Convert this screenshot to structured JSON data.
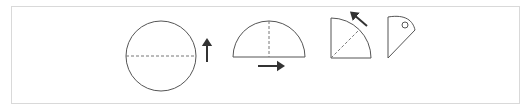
{
  "panel": {
    "name": "geometric-figures-panel",
    "background_color": "#ffffff",
    "border_color": "#d9d9d9",
    "x": 11,
    "y": 6,
    "width": 509,
    "height": 98
  },
  "style": {
    "outline_color": "#555555",
    "axis_color": "#777777",
    "arrow_color": "#333333",
    "outline_width": 1,
    "axis_dash": "3,2"
  },
  "figures": [
    {
      "id": "figure-1",
      "name": "circle-with-horizontal-axis",
      "shape": "circle",
      "description": "Full circle with a horizontal dashed diameter and an upward arrow at its right",
      "center": {
        "x": 161,
        "y": 56
      },
      "radius": 35,
      "axis": {
        "orientation": "horizontal",
        "style": "dashed",
        "from": {
          "x": 126,
          "y": 56
        },
        "to": {
          "x": 196,
          "y": 56
        }
      },
      "arrow": {
        "name": "up-arrow",
        "direction": "up",
        "from": {
          "x": 207,
          "y": 62
        },
        "to": {
          "x": 207,
          "y": 42
        }
      }
    },
    {
      "id": "figure-2",
      "name": "semicircle-with-vertical-axis",
      "shape": "semicircle",
      "description": "Half disc (dome) on a horizontal base, vertical dashed axis of symmetry, rightward arrow below the base",
      "center": {
        "x": 269,
        "y": 57
      },
      "radius": 36,
      "base": {
        "from": {
          "x": 233,
          "y": 57
        },
        "to": {
          "x": 305,
          "y": 57
        }
      },
      "axis": {
        "orientation": "vertical",
        "style": "dashed",
        "from": {
          "x": 269,
          "y": 21
        },
        "to": {
          "x": 269,
          "y": 57
        }
      },
      "arrow": {
        "name": "right-arrow",
        "direction": "right",
        "from": {
          "x": 258,
          "y": 66
        },
        "to": {
          "x": 281,
          "y": 66
        }
      }
    },
    {
      "id": "figure-3",
      "name": "quarter-circle-with-diagonal-axis",
      "shape": "quarter-circle",
      "description": "Quarter disc with vertical left leg, horizontal bottom leg, arc from top-left to bottom-right, dashed diagonal radius and diagonal arrow pointing up-left",
      "corner": {
        "x": 331,
        "y": 58
      },
      "radius": 40,
      "legs": {
        "vertical": {
          "from": {
            "x": 331,
            "y": 18
          },
          "to": {
            "x": 331,
            "y": 58
          }
        },
        "horizontal": {
          "from": {
            "x": 331,
            "y": 58
          },
          "to": {
            "x": 371,
            "y": 58
          }
        }
      },
      "axis": {
        "orientation": "diagonal",
        "style": "dashed",
        "from": {
          "x": 331,
          "y": 58
        },
        "to": {
          "x": 359,
          "y": 30
        }
      },
      "arrow": {
        "name": "diagonal-up-left-arrow",
        "direction": "up-left",
        "from": {
          "x": 367,
          "y": 26
        },
        "to": {
          "x": 353,
          "y": 14
        }
      }
    },
    {
      "id": "figure-4",
      "name": "cone-profile-with-circle-marker",
      "shape": "cone-profile",
      "description": "Right-pointing cone profile: straight vertical left edge, curved upper-right edge, straight lower-right edge, with a small circle marker near the tip",
      "vertices": {
        "top_left": {
          "x": 388,
          "y": 17
        },
        "bottom_left": {
          "x": 388,
          "y": 58
        },
        "tip": {
          "x": 415,
          "y": 30
        }
      },
      "curve_control": {
        "x": 406,
        "y": 14
      },
      "marker": {
        "name": "small-circle-marker",
        "center": {
          "x": 405,
          "y": 25
        },
        "radius": 3
      }
    }
  ]
}
